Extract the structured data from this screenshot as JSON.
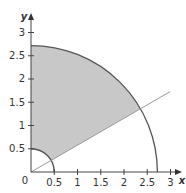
{
  "diagram": {
    "type": "polar-region",
    "axes": {
      "x_label": "x",
      "y_label": "y",
      "origin_label": "0",
      "x_ticks": [
        "0.5",
        "1",
        "1.5",
        "2",
        "2.5",
        "3"
      ],
      "y_ticks": [
        "0.5",
        "1",
        "1.5",
        "2",
        "2.5",
        "3"
      ]
    },
    "inner_radius": 0.5,
    "outer_radius": 2.718,
    "theta_start_deg": 30,
    "theta_end_deg": 90,
    "colors": {
      "shade": "#c8c8c8",
      "curve": "#555555",
      "line": "#9a9a9a",
      "axis": "#444444"
    }
  }
}
